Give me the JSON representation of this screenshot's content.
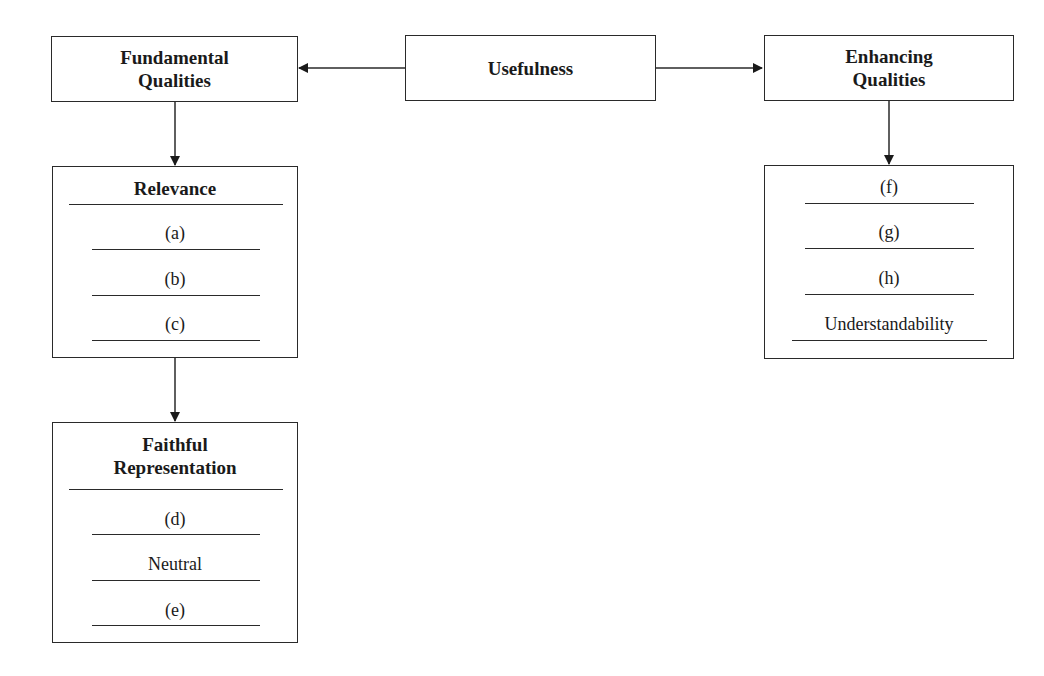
{
  "diagram": {
    "root": {
      "label": "Usefulness"
    },
    "fundamental": {
      "title_line1": "Fundamental",
      "title_line2": "Qualities",
      "relevance": {
        "title": "Relevance",
        "items": [
          "(a)",
          "(b)",
          "(c)"
        ]
      },
      "faithful_representation": {
        "title_line1": "Faithful",
        "title_line2": "Representation",
        "items": [
          "(d)",
          "Neutral",
          "(e)"
        ]
      }
    },
    "enhancing": {
      "title_line1": "Enhancing",
      "title_line2": "Qualities",
      "items": [
        "(f)",
        "(g)",
        "(h)",
        "Understandability"
      ]
    },
    "edges": [
      {
        "from": "Usefulness",
        "to": "Fundamental Qualities"
      },
      {
        "from": "Usefulness",
        "to": "Enhancing Qualities"
      },
      {
        "from": "Fundamental Qualities",
        "to": "Relevance"
      },
      {
        "from": "Relevance",
        "to": "Faithful Representation"
      },
      {
        "from": "Enhancing Qualities",
        "to": "Enhancing Qualities list"
      }
    ],
    "colors": {
      "line": "#2a2a2a",
      "background": "#ffffff",
      "text": "#1a1a1a"
    }
  }
}
